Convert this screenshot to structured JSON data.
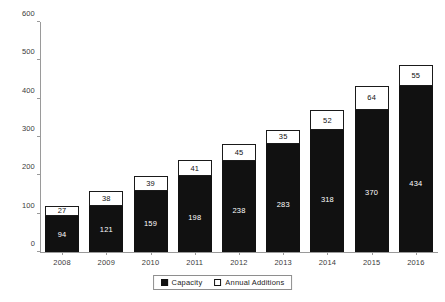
{
  "chart_data": {
    "type": "bar",
    "subtype": "stacked-bar",
    "title": "",
    "xlabel": "",
    "ylabel": "",
    "ylim": [
      0,
      600
    ],
    "yticks": [
      0,
      100,
      200,
      300,
      400,
      500,
      600
    ],
    "ytick_labels": [
      "0",
      "100",
      "200",
      "300",
      "400",
      "500",
      "600"
    ],
    "grid": false,
    "legend_position": "bottom-center",
    "categories": [
      "2008",
      "2009",
      "2010",
      "2011",
      "2012",
      "2013",
      "2014",
      "2015",
      "2016"
    ],
    "series": [
      {
        "name": "Capacity",
        "color": "#111111",
        "values": [
          94,
          121,
          159,
          198,
          238,
          283,
          318,
          370,
          434
        ]
      },
      {
        "name": "Annual Additions",
        "color": "#ffffff",
        "border_color": "#111111",
        "values": [
          27,
          38,
          39,
          41,
          45,
          35,
          52,
          64,
          55
        ]
      }
    ],
    "totals": [
      121,
      159,
      198,
      239,
      283,
      318,
      370,
      434,
      489
    ]
  },
  "legend": {
    "items": [
      {
        "label": "Capacity",
        "swatch": "filled-square-icon"
      },
      {
        "label": "Annual Additions",
        "swatch": "outlined-square-icon"
      }
    ]
  },
  "axes": {
    "y_axis_color": "#9a9a9a",
    "x_axis_color": "#9a9a9a",
    "label_color": "#3b3b3b"
  }
}
